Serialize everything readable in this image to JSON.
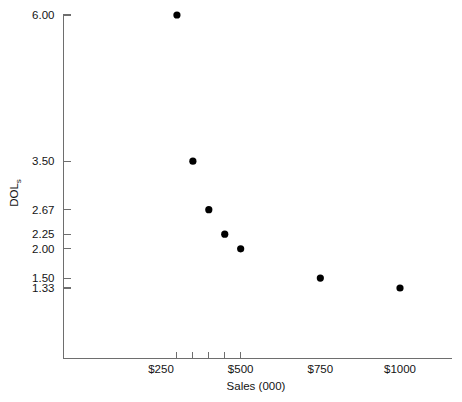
{
  "chart_data": {
    "type": "scatter",
    "title": "",
    "xlabel": "Sales (000)",
    "ylabel": "DOL",
    "ylabel_subscript": "s",
    "x": [
      300,
      350,
      400,
      450,
      500,
      750,
      1000
    ],
    "values": [
      6.0,
      3.5,
      2.67,
      2.25,
      2.0,
      1.5,
      1.33
    ],
    "points": [
      {
        "x": 300,
        "y": 6.0
      },
      {
        "x": 350,
        "y": 3.5
      },
      {
        "x": 400,
        "y": 2.67
      },
      {
        "x": 450,
        "y": 2.25
      },
      {
        "x": 500,
        "y": 2.0
      },
      {
        "x": 750,
        "y": 1.5
      },
      {
        "x": 1000,
        "y": 1.33
      }
    ],
    "ytick_labels": [
      "6.00",
      "3.50",
      "2.67",
      "2.25",
      "2.00",
      "1.50",
      "1.33"
    ],
    "ytick_values": [
      6.0,
      3.5,
      2.67,
      2.25,
      2.0,
      1.5,
      1.33
    ],
    "xtick_labels": [
      "$250",
      "$500",
      "$750",
      "$1000"
    ],
    "xtick_values": [
      250,
      500,
      750,
      1000
    ],
    "xtick_marks": [
      300,
      350,
      400,
      450,
      500
    ],
    "xlim": [
      0,
      1100
    ],
    "ylim": [
      0.9,
      6.2
    ],
    "grid": false,
    "legend": null,
    "marker_color": "#000000",
    "axis_color": "#6e6e6e"
  }
}
